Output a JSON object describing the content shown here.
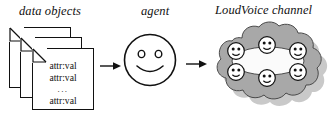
{
  "figure": {
    "captions": {
      "data_objects": "data objects",
      "agent": "agent",
      "channel": "LoudVoice channel"
    },
    "documents": {
      "count": 3,
      "label": "data-object-card",
      "lines": [
        "attr:val",
        "attr:val",
        "...",
        "attr:val"
      ],
      "ellipsis": "..."
    },
    "agent": {
      "icon": "smiley-face",
      "expression": "smiling"
    },
    "channel": {
      "icon": "cloud",
      "node_icon": "smiley-face-node",
      "node_count": 6,
      "ring_shape": "ellipse"
    },
    "arrows": [
      {
        "name": "arrow-data-to-agent",
        "direction": "right"
      },
      {
        "name": "arrow-agent-to-channel",
        "direction": "right"
      }
    ],
    "colors": {
      "ink": "#111111",
      "paper": "#ffffff",
      "cloud_fill": "#a8a8a8",
      "cloud_shadow": "#c9c9c9",
      "ring_fill": "#fbfbfb"
    }
  }
}
